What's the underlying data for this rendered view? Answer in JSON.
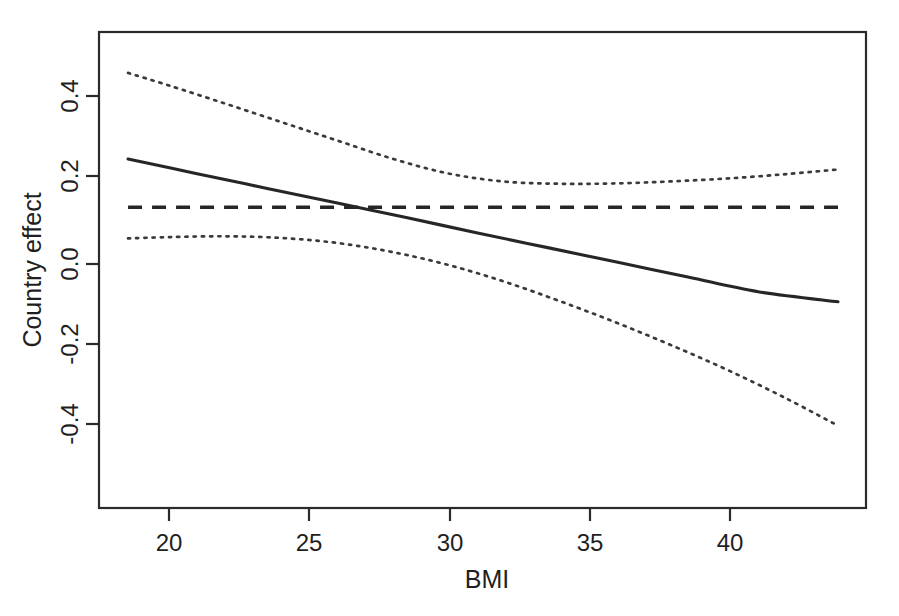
{
  "chart_data": {
    "type": "line",
    "title": "",
    "xlabel": "BMI",
    "ylabel": "Country effect",
    "xlim": [
      17.6,
      44.6
    ],
    "ylim": [
      -0.56,
      0.56
    ],
    "grid": false,
    "legend": null,
    "x_ticks": [
      20,
      25,
      30,
      35,
      40
    ],
    "x_tick_labels": [
      "20",
      "25",
      "30",
      "35",
      "40"
    ],
    "y_ticks": [
      -0.4,
      -0.2,
      0.0,
      0.2,
      0.4
    ],
    "y_tick_labels": [
      "-0.4",
      "-0.2",
      "0.0",
      "0.2",
      "0.4"
    ],
    "x_range_data": [
      18.54,
      43.85
    ],
    "series": [
      {
        "name": "Estimated country effect",
        "style": "solid",
        "color": "#262626",
        "x": [
          18.54,
          21.0,
          23.5,
          26.0,
          28.5,
          31.0,
          33.5,
          36.0,
          38.5,
          41.0,
          43.85
        ],
        "values": [
          0.25,
          0.215,
          0.18,
          0.145,
          0.11,
          0.074,
          0.039,
          0.004,
          -0.031,
          -0.066,
          -0.09
        ]
      },
      {
        "name": "Upper 95% confidence limit",
        "style": "dotted",
        "color": "#3a3a3a",
        "x": [
          18.54,
          20.0,
          22.0,
          24.0,
          26.0,
          28.0,
          30.0,
          32.0,
          34.0,
          36.0,
          38.0,
          40.0,
          42.0,
          43.85
        ],
        "values": [
          0.455,
          0.425,
          0.382,
          0.338,
          0.294,
          0.25,
          0.215,
          0.196,
          0.191,
          0.192,
          0.197,
          0.204,
          0.214,
          0.225
        ]
      },
      {
        "name": "Lower 95% confidence limit",
        "style": "dotted",
        "color": "#3a3a3a",
        "x": [
          18.54,
          20.0,
          22.0,
          24.0,
          26.0,
          28.0,
          30.0,
          32.0,
          34.0,
          36.0,
          38.0,
          40.0,
          42.0,
          43.85
        ],
        "values": [
          0.061,
          0.064,
          0.066,
          0.062,
          0.05,
          0.028,
          -0.003,
          -0.043,
          -0.09,
          -0.141,
          -0.196,
          -0.255,
          -0.32,
          -0.385
        ]
      },
      {
        "name": "Overall mean reference",
        "style": "dashed",
        "color": "#262626",
        "x": [
          18.54,
          43.85
        ],
        "values": [
          0.135,
          0.135
        ]
      }
    ]
  }
}
